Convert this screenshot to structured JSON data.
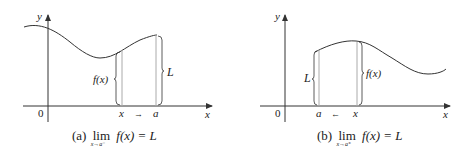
{
  "panels": [
    {
      "id": "a",
      "labels": {
        "y": "y",
        "x_axis": "x",
        "origin": "0",
        "x_point": "x",
        "a_point": "a",
        "fx": "f(x)",
        "L": "L",
        "arrow": "→"
      },
      "caption": {
        "prefix": "(a) ",
        "lim": "lim",
        "sub": "x→a⁻",
        "expr": " f(x) = L"
      }
    },
    {
      "id": "b",
      "labels": {
        "y": "y",
        "x_axis": "x",
        "origin": "0",
        "x_point": "x",
        "a_point": "a",
        "fx": "f(x)",
        "L": "L",
        "arrow": "←"
      },
      "caption": {
        "prefix": "(b) ",
        "lim": "lim",
        "sub": "x→a⁺",
        "expr": " f(x) = L"
      }
    }
  ]
}
